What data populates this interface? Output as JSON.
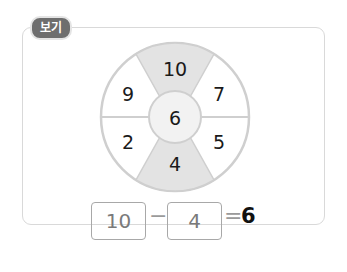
{
  "label": "보기",
  "wheel": {
    "center": "6",
    "segments": {
      "top": "10",
      "top_left": "9",
      "top_right": "7",
      "bottom_left": "2",
      "bottom_right": "5",
      "bottom": "4"
    },
    "shaded_color": "#e3e3e3",
    "center_color": "#f2f2f2",
    "line_color": "#cfcfcf"
  },
  "equation": {
    "left": "10",
    "operator": "−",
    "right": "4",
    "equals": "=",
    "result": "6"
  }
}
